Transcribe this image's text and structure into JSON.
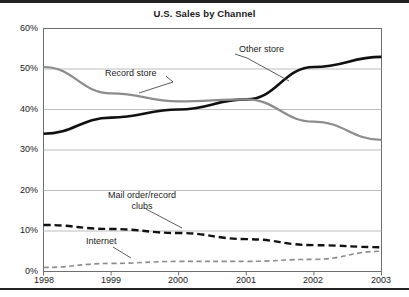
{
  "chart_data": {
    "type": "line",
    "title": "U.S. Sales by Channel",
    "xlabel": "",
    "ylabel": "",
    "x": [
      1998,
      1999,
      2000,
      2001,
      2002,
      2003
    ],
    "categories": [
      "1998",
      "1999",
      "2000",
      "2001",
      "2002",
      "2003"
    ],
    "xtick_labels": [
      "1998",
      "1999",
      "2000",
      "2001",
      "2002",
      "2003"
    ],
    "ytick_labels": [
      "0%",
      "10%",
      "20%",
      "30%",
      "40%",
      "50%",
      "60%"
    ],
    "ytick_values": [
      0,
      10,
      20,
      30,
      40,
      50,
      60
    ],
    "ylim": [
      0,
      60
    ],
    "xlim": [
      1998,
      2003
    ],
    "grid": "horizontal",
    "legend": "inline-annotations",
    "units": "percent",
    "series": [
      {
        "name": "Other store",
        "values": [
          34.0,
          38.0,
          40.0,
          42.5,
          50.5,
          53.0
        ],
        "color": "#111111",
        "style": "solid",
        "width": 2.6
      },
      {
        "name": "Record store",
        "values": [
          50.5,
          44.0,
          42.0,
          42.5,
          37.0,
          32.5
        ],
        "color": "#8c8c8c",
        "style": "solid",
        "width": 2.2
      },
      {
        "name": "Mail order/record clubs",
        "values": [
          11.5,
          10.5,
          9.5,
          8.0,
          6.5,
          6.0
        ],
        "color": "#111111",
        "style": "dashed",
        "width": 2.4
      },
      {
        "name": "Internet",
        "values": [
          1.0,
          2.0,
          2.5,
          2.5,
          3.0,
          5.0
        ],
        "color": "#8c8c8c",
        "style": "dashed",
        "width": 1.6
      }
    ],
    "annotations": [
      {
        "text": "Other store",
        "series": "Other store"
      },
      {
        "text": "Record store",
        "series": "Record store"
      },
      {
        "text": "Mail order/record",
        "text2": "clubs",
        "series": "Mail order/record clubs"
      },
      {
        "text": "Internet",
        "series": "Internet"
      }
    ]
  },
  "labels": {
    "y": [
      "60%",
      "50%",
      "40%",
      "30%",
      "20%",
      "10%",
      "0%"
    ],
    "x": [
      "1998",
      "1999",
      "2000",
      "2001",
      "2002",
      "2003"
    ],
    "other_store": "Other store",
    "record_store": "Record store",
    "mail_order_line1": "Mail order/record",
    "mail_order_line2": "clubs",
    "internet": "Internet"
  }
}
